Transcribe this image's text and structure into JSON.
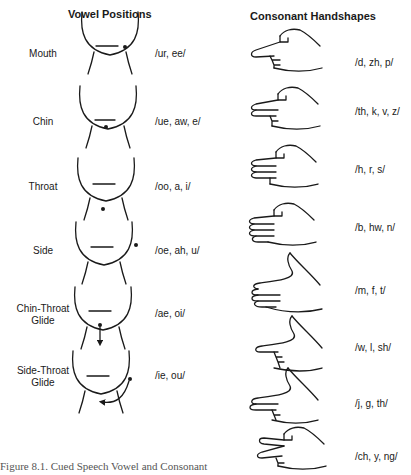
{
  "vowel_column": {
    "title": "Vowel Positions",
    "rows": [
      {
        "label_line1": "Mouth",
        "label_line2": "",
        "sounds": "/ur, ee/"
      },
      {
        "label_line1": "Chin",
        "label_line2": "",
        "sounds": "/ue, aw, e/"
      },
      {
        "label_line1": "Throat",
        "label_line2": "",
        "sounds": "/oo, a, i/"
      },
      {
        "label_line1": "Side",
        "label_line2": "",
        "sounds": "/oe, ah, u/"
      },
      {
        "label_line1": "Chin-Throat",
        "label_line2": "Glide",
        "sounds": "/ae, oi/"
      },
      {
        "label_line1": "Side-Throat",
        "label_line2": "Glide",
        "sounds": "/ie, ou/"
      }
    ]
  },
  "consonant_column": {
    "title": "Consonant Handshapes",
    "rows": [
      {
        "sounds": "/d, zh, p/"
      },
      {
        "sounds": "/th, k, v, z/"
      },
      {
        "sounds": "/h, r, s/"
      },
      {
        "sounds": "/b, hw, n/"
      },
      {
        "sounds": "/m, f, t/"
      },
      {
        "sounds": "/w, l, sh/"
      },
      {
        "sounds": "/j, g, th/"
      },
      {
        "sounds": "/ch, y, ng/"
      }
    ]
  },
  "caption": "Figure 8.1. Cued Speech Vowel and Consonant"
}
